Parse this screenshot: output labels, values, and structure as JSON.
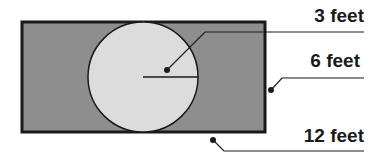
{
  "diagram": {
    "colors": {
      "rectangle_fill": "#8e8e8e",
      "rectangle_stroke": "#1a1a1a",
      "circle_fill": "#dcdcdc",
      "circle_stroke": "#1a1a1a",
      "leader_lines": "#1a1a1a",
      "background": "#ffffff"
    },
    "shapes": {
      "rectangle": {
        "x": 22,
        "y": 22,
        "width": 243,
        "height": 110
      },
      "circle": {
        "cx": 143,
        "cy": 77,
        "r": 55
      },
      "radius_line": {
        "x1": 143,
        "y1": 77,
        "x2": 198,
        "y2": 77
      }
    },
    "callouts": [
      {
        "id": "radius",
        "label": "3 feet",
        "points": "167,70 205,32 364,32",
        "dot": {
          "cx": 167,
          "cy": 70
        }
      },
      {
        "id": "width",
        "label": "6 feet",
        "points": "271,90 282,78 364,78",
        "dot": {
          "cx": 271,
          "cy": 90
        }
      },
      {
        "id": "length",
        "label": "12 feet",
        "points": "213,140 224,151 364,151",
        "dot": {
          "cx": 213,
          "cy": 140
        }
      }
    ]
  }
}
